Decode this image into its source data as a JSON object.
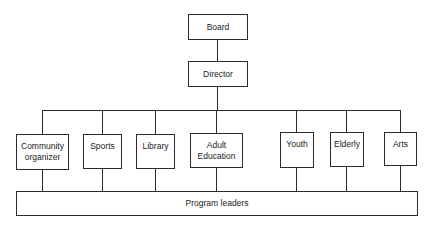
{
  "diagram": {
    "type": "org-chart",
    "nodes": {
      "board": {
        "label": "Board"
      },
      "director": {
        "label": "Director"
      },
      "departments": [
        {
          "label_line1": "Community",
          "label_line2": "organizer"
        },
        {
          "label_line1": "Sports",
          "label_line2": ""
        },
        {
          "label_line1": "Library",
          "label_line2": ""
        },
        {
          "label_line1": "Adult",
          "label_line2": "Education"
        },
        {
          "label_line1": "Youth",
          "label_line2": ""
        },
        {
          "label_line1": "Elderly",
          "label_line2": ""
        },
        {
          "label_line1": "Arts",
          "label_line2": ""
        }
      ],
      "program_leaders": {
        "label": "Program leaders"
      }
    },
    "edges": [
      [
        "Board",
        "Director"
      ],
      [
        "Director",
        "Community organizer"
      ],
      [
        "Director",
        "Sports"
      ],
      [
        "Director",
        "Library"
      ],
      [
        "Director",
        "Adult Education"
      ],
      [
        "Director",
        "Youth"
      ],
      [
        "Director",
        "Elderly"
      ],
      [
        "Director",
        "Arts"
      ],
      [
        "Community organizer",
        "Program leaders"
      ],
      [
        "Sports",
        "Program leaders"
      ],
      [
        "Library",
        "Program leaders"
      ],
      [
        "Adult Education",
        "Program leaders"
      ],
      [
        "Youth",
        "Program leaders"
      ],
      [
        "Elderly",
        "Program leaders"
      ],
      [
        "Arts",
        "Program leaders"
      ]
    ]
  }
}
